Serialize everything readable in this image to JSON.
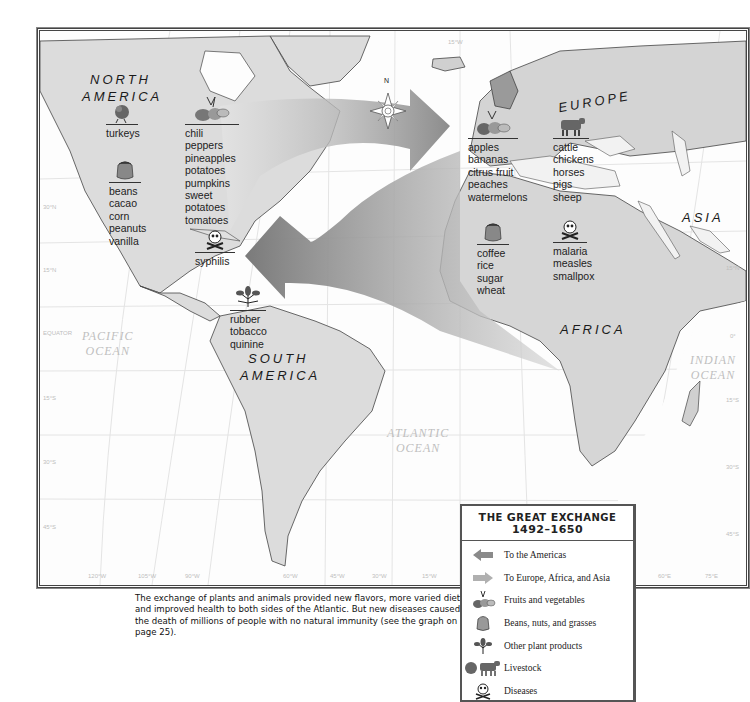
{
  "map": {
    "regions": {
      "north_america": [
        "NORTH",
        "AMERICA"
      ],
      "south_america": [
        "SOUTH",
        "AMERICA"
      ],
      "europe": "EUROPE",
      "africa": "AFRICA",
      "asia": "ASIA"
    },
    "oceans": {
      "pacific": [
        "PACIFIC",
        "OCEAN"
      ],
      "atlantic": [
        "ATLANTIC",
        "OCEAN"
      ],
      "indian": [
        "INDIAN",
        "OCEAN"
      ]
    },
    "compass_label": "N",
    "latitude_labels": {
      "left": [
        "30°N",
        "15°N",
        "EQUATOR",
        "15°S",
        "30°S",
        "45°S"
      ],
      "right": [
        "15°N",
        "0°",
        "15°S",
        "30°S",
        "45°S"
      ]
    },
    "longitude_labels": [
      "120°W",
      "105°W",
      "90°W",
      "60°W",
      "45°W",
      "30°W",
      "15°W",
      "60°E",
      "75°E"
    ],
    "top_longitude_label": "15°W",
    "groups": {
      "na_livestock": {
        "category": "Livestock",
        "items": [
          "turkeys"
        ]
      },
      "na_fruits": {
        "category": "Fruits and vegetables",
        "items": [
          "chili peppers",
          "pineapples",
          "potatoes",
          "pumpkins",
          "sweet potatoes",
          "tomatoes"
        ]
      },
      "na_beans": {
        "category": "Beans, nuts, and grasses",
        "items": [
          "beans",
          "cacao",
          "corn",
          "peanuts",
          "vanilla"
        ]
      },
      "na_disease": {
        "category": "Diseases",
        "items": [
          "syphilis"
        ]
      },
      "sa_other": {
        "category": "Other plant products",
        "items": [
          "rubber",
          "tobacco",
          "quinine"
        ]
      },
      "eu_fruits": {
        "category": "Fruits and vegetables",
        "items": [
          "apples",
          "bananas",
          "citrus fruit",
          "peaches",
          "watermelons"
        ]
      },
      "eu_livestock": {
        "category": "Livestock",
        "items": [
          "cattle",
          "chickens",
          "horses",
          "pigs",
          "sheep"
        ]
      },
      "af_beans": {
        "category": "Beans, nuts, and grasses",
        "items": [
          "coffee",
          "rice",
          "sugar",
          "wheat"
        ]
      },
      "af_disease": {
        "category": "Diseases",
        "items": [
          "malaria",
          "measles",
          "smallpox"
        ]
      }
    }
  },
  "caption": "The exchange of plants and animals provided new flavors, more varied diets, and improved health to both sides of the Atlantic. But new diseases caused the death of millions of people with no natural immunity (see the graph on page 25).",
  "legend": {
    "title_line1_first": "T",
    "title_line1_rest": "HE ",
    "title_line1_g": "G",
    "title_line1_reat": "REAT ",
    "title_line1_e": "E",
    "title_line1_xchange": "XCHANGE",
    "title_line2": "1492–1650",
    "items": [
      {
        "icon": "arrow-left-icon",
        "label": "To the Americas"
      },
      {
        "icon": "arrow-right-icon",
        "label": "To Europe, Africa, and Asia"
      },
      {
        "icon": "fruits-icon",
        "label": "Fruits and vegetables"
      },
      {
        "icon": "sack-icon",
        "label": "Beans, nuts, and grasses"
      },
      {
        "icon": "leaf-icon",
        "label": "Other plant products"
      },
      {
        "icon": "livestock-icon",
        "label": "Livestock"
      },
      {
        "icon": "skull-icon",
        "label": "Diseases"
      }
    ]
  },
  "colors": {
    "land": "#d9d9d9",
    "land_light": "#ececec",
    "ocean": "#fdfdfd",
    "arrow_to_americas": "#8a8a8a",
    "arrow_to_old_world": "#a8a8a8",
    "grid": "#e2e2e2"
  }
}
